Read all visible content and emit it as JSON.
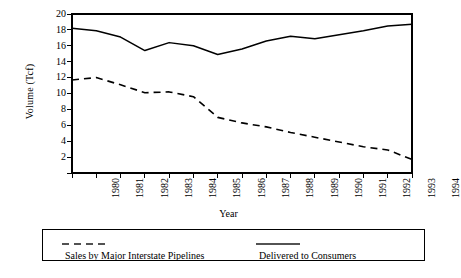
{
  "chart_data": {
    "type": "line",
    "title": "",
    "xlabel": "Year",
    "ylabel": "Volume (Tcf)",
    "x": [
      1980,
      1981,
      1982,
      1983,
      1984,
      1985,
      1986,
      1987,
      1988,
      1989,
      1990,
      1991,
      1992,
      1993,
      1994
    ],
    "xticklabels": [
      "1980",
      "1981",
      "1982",
      "1983",
      "1984",
      "1985",
      "1986",
      "1987",
      "1988",
      "1989",
      "1990",
      "1991",
      "1992",
      "1993",
      "1994"
    ],
    "yticklabels": [
      "20",
      "18",
      "16",
      "14",
      "12",
      "10",
      "8",
      "6",
      "4",
      "2"
    ],
    "yticks": [
      20,
      18,
      16,
      14,
      12,
      10,
      8,
      6,
      4,
      2
    ],
    "ylim": [
      0,
      20
    ],
    "xlim": [
      1980,
      1994
    ],
    "grid": false,
    "legend_position": "bottom",
    "series": [
      {
        "name": "Sales by Major Interstate Pipelines",
        "style": "dashed",
        "color": "#000000",
        "values": [
          11.7,
          12.0,
          11.1,
          10.1,
          10.2,
          9.6,
          7.0,
          6.3,
          5.8,
          5.1,
          4.5,
          3.9,
          3.3,
          2.9,
          1.7
        ]
      },
      {
        "name": "Delivered to Consumers",
        "style": "solid",
        "color": "#000000",
        "values": [
          18.2,
          17.9,
          17.1,
          15.4,
          16.4,
          16.0,
          14.9,
          15.6,
          16.6,
          17.2,
          16.9,
          17.4,
          17.9,
          18.5,
          18.7
        ]
      }
    ]
  },
  "legend": {
    "entries": [
      {
        "label": "Sales by Major Interstate Pipelines",
        "style": "dashed"
      },
      {
        "label": "Delivered to Consumers",
        "style": "solid"
      }
    ]
  },
  "axes": {
    "x_title": "Year",
    "y_title": "Volume (Tcf)"
  }
}
